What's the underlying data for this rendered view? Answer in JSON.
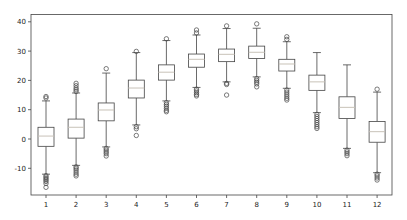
{
  "chart_data": {
    "type": "boxplot",
    "title": "",
    "xlabel": "",
    "ylabel": "",
    "categories": [
      "1",
      "2",
      "3",
      "4",
      "5",
      "6",
      "7",
      "8",
      "9",
      "10",
      "11",
      "12"
    ],
    "ylim": [
      -19,
      43
    ],
    "yticks": [
      -10,
      0,
      10,
      20,
      30,
      40
    ],
    "grid": false,
    "legend": null,
    "boxes": [
      {
        "label": "1",
        "whislo": -12.0,
        "q1": -2.5,
        "med": 1.0,
        "q3": 4.0,
        "whishi": 13.0,
        "fliers": [
          -12.5,
          -13,
          -13.5,
          -14,
          -14.5,
          -15.2,
          -16.5,
          14.0,
          14.5
        ]
      },
      {
        "label": "2",
        "whislo": -9.0,
        "q1": 0.3,
        "med": 4.0,
        "q3": 6.8,
        "whishi": 15.7,
        "fliers": [
          -9.5,
          -10,
          -10.6,
          -11.3,
          -12.0,
          -12.6,
          16.2,
          16.8,
          17.4,
          18.2,
          19.0
        ]
      },
      {
        "label": "3",
        "whislo": -2.7,
        "q1": 6.2,
        "med": 9.9,
        "q3": 12.3,
        "whishi": 22.5,
        "fliers": [
          -3.2,
          -3.8,
          -4.4,
          -5.0,
          -5.8,
          24.0
        ]
      },
      {
        "label": "4",
        "whislo": 4.8,
        "q1": 14.0,
        "med": 17.4,
        "q3": 20.1,
        "whishi": 29.5,
        "fliers": [
          4.2,
          3.5,
          1.2,
          29.9
        ]
      },
      {
        "label": "5",
        "whislo": 13.0,
        "q1": 20.1,
        "med": 22.8,
        "q3": 25.3,
        "whishi": 33.6,
        "fliers": [
          12.4,
          11.8,
          11.2,
          10.5,
          9.8,
          9.3,
          34.2
        ]
      },
      {
        "label": "6",
        "whislo": 17.6,
        "q1": 24.5,
        "med": 27.2,
        "q3": 29.0,
        "whishi": 35.5,
        "fliers": [
          17.0,
          16.4,
          15.8,
          15.2,
          14.7,
          36.2,
          37.2
        ]
      },
      {
        "label": "7",
        "whislo": 19.5,
        "q1": 26.4,
        "med": 28.9,
        "q3": 30.7,
        "whishi": 37.7,
        "fliers": [
          19.0,
          18.6,
          15.0,
          38.6
        ]
      },
      {
        "label": "8",
        "whislo": 21.2,
        "q1": 27.5,
        "med": 29.6,
        "q3": 31.7,
        "whishi": 37.8,
        "fliers": [
          20.6,
          20.0,
          19.4,
          18.8,
          17.8,
          39.3
        ]
      },
      {
        "label": "9",
        "whislo": 17.3,
        "q1": 23.2,
        "med": 25.6,
        "q3": 27.2,
        "whishi": 33.2,
        "fliers": [
          16.7,
          16.0,
          15.3,
          14.6,
          13.9,
          13.3,
          34.0,
          34.9
        ]
      },
      {
        "label": "10",
        "whislo": 9.0,
        "q1": 16.6,
        "med": 19.5,
        "q3": 21.8,
        "whishi": 29.5,
        "fliers": [
          8.4,
          7.7,
          7.0,
          6.3,
          5.6,
          4.9,
          4.2,
          3.6
        ]
      },
      {
        "label": "11",
        "whislo": -3.2,
        "q1": 7.0,
        "med": 10.8,
        "q3": 14.4,
        "whishi": 25.3,
        "fliers": [
          -3.8,
          -4.4,
          -5.0,
          -5.7
        ]
      },
      {
        "label": "12",
        "whislo": -11.5,
        "q1": -1.1,
        "med": 2.5,
        "q3": 6.0,
        "whishi": 16.0,
        "fliers": [
          -12.0,
          -12.6,
          -13.3,
          -14.0,
          17.0
        ]
      }
    ]
  },
  "style": {
    "box_color": "#444444",
    "median_color": "#c8c2b8",
    "frame_color": "#444444",
    "flier_color": "#444444"
  }
}
